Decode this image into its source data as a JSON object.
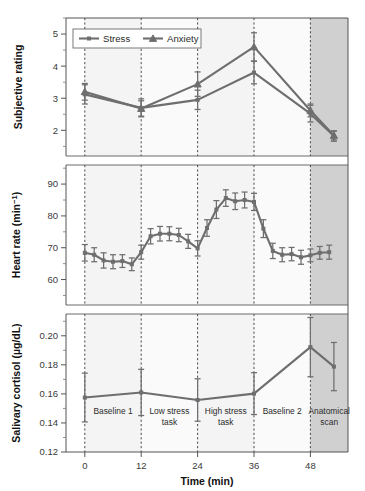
{
  "figure": {
    "xlabel": "Time (min)",
    "x_ticks": [
      0,
      12,
      24,
      36,
      48
    ],
    "x_range": [
      -4,
      56
    ],
    "phases": [
      {
        "label_line1": "Baseline 1",
        "label_line2": "",
        "start": 0,
        "end": 12
      },
      {
        "label_line1": "Low stress",
        "label_line2": "task",
        "start": 12,
        "end": 24
      },
      {
        "label_line1": "High stress",
        "label_line2": "task",
        "start": 24,
        "end": 36
      },
      {
        "label_line1": "Baseline 2",
        "label_line2": "",
        "start": 36,
        "end": 48
      },
      {
        "label_line1": "Anatomical",
        "label_line2": "scan",
        "start": 48,
        "end": 56
      }
    ],
    "phase_boundaries": [
      0,
      12,
      24,
      36,
      48
    ],
    "colors": {
      "line": "#6e6e6e",
      "axis": "#555555",
      "shade_light": "#f4f4f4",
      "shade_dark": "#c8c8c8",
      "text": "#1a1a1a"
    }
  },
  "chart_data": [
    {
      "type": "line",
      "panel": "subjective-rating",
      "title": "",
      "xlabel": "Time (min)",
      "ylabel": "Subjective rating",
      "ylim": [
        1.2,
        5.5
      ],
      "yticks": [
        2,
        3,
        4,
        5
      ],
      "grid": false,
      "legend": [
        "Stress",
        "Anxiety"
      ],
      "legend_position": "top-left",
      "x": [
        0,
        12,
        24,
        36,
        48,
        53
      ],
      "series": [
        {
          "name": "Stress",
          "marker": "square",
          "values": [
            3.12,
            2.7,
            2.95,
            3.8,
            2.52,
            1.82
          ],
          "errors": [
            0.3,
            0.28,
            0.3,
            0.35,
            0.26,
            0.16
          ]
        },
        {
          "name": "Anxiety",
          "marker": "triangle",
          "values": [
            3.2,
            2.68,
            3.44,
            4.6,
            2.62,
            1.84
          ],
          "errors": [
            0.26,
            0.24,
            0.38,
            0.44,
            0.2,
            0.14
          ]
        }
      ]
    },
    {
      "type": "line",
      "panel": "heart-rate",
      "title": "",
      "xlabel": "Time (min)",
      "ylabel": "Heart rate (min−1)",
      "ylim": [
        52,
        96
      ],
      "yticks": [
        60,
        70,
        80,
        90
      ],
      "grid": false,
      "legend": [],
      "x": [
        0,
        2,
        4,
        6,
        8,
        10,
        12,
        14,
        16,
        18,
        20,
        22,
        24,
        26,
        28,
        30,
        32,
        34,
        36,
        38,
        40,
        42,
        44,
        46,
        48,
        50,
        52
      ],
      "series": [
        {
          "name": "Heart rate",
          "marker": "square",
          "values": [
            68.4,
            67.8,
            66.0,
            65.6,
            65.8,
            64.8,
            68.6,
            73.6,
            74.4,
            74.4,
            74.0,
            72.0,
            69.8,
            76.2,
            82.0,
            85.6,
            84.6,
            85.0,
            84.4,
            76.0,
            69.0,
            67.8,
            68.0,
            67.0,
            67.6,
            68.4,
            68.6
          ],
          "errors": [
            2.6,
            2.2,
            2.4,
            2.2,
            2.0,
            2.0,
            2.2,
            2.4,
            2.3,
            2.2,
            2.1,
            2.2,
            2.4,
            2.6,
            2.8,
            2.6,
            2.6,
            2.5,
            2.7,
            2.8,
            2.4,
            2.2,
            2.1,
            2.2,
            2.0,
            2.0,
            2.2
          ]
        }
      ]
    },
    {
      "type": "line",
      "panel": "salivary-cortisol",
      "title": "",
      "xlabel": "Time (min)",
      "ylabel": "Salivary cortisol (µg/dL)",
      "ylim": [
        0.12,
        0.215
      ],
      "yticks": [
        0.12,
        0.14,
        0.16,
        0.18,
        0.2
      ],
      "ytick_labels": [
        "0.12",
        "0.14",
        "0.16",
        "0.18",
        "0.20"
      ],
      "grid": false,
      "legend": [],
      "x": [
        0,
        12,
        24,
        36,
        48,
        53
      ],
      "series": [
        {
          "name": "Salivary cortisol",
          "marker": "square",
          "values": [
            0.1575,
            0.161,
            0.1558,
            0.1602,
            0.1922,
            0.1788
          ],
          "errors": [
            0.0168,
            0.0159,
            0.0146,
            0.0144,
            0.0204,
            0.0166
          ]
        }
      ]
    }
  ]
}
